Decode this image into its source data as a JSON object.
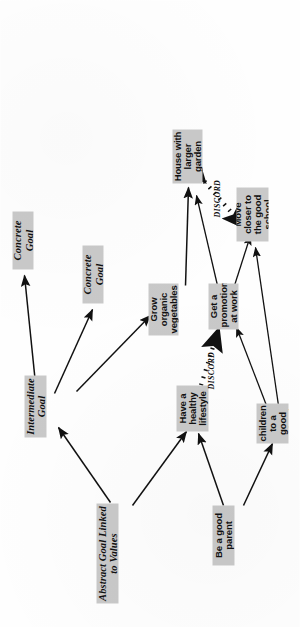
{
  "figure": {
    "box_fill_color": "#c9c9c9",
    "line_color": "#111111",
    "background_color": "#ffffff"
  },
  "legend_nodes": [
    {
      "id": "abstract",
      "label": "Abstract Goal Linked to Values"
    },
    {
      "id": "intermediate",
      "label": "Intermediate Goal"
    },
    {
      "id": "concrete_top",
      "label": "Concrete Goal"
    },
    {
      "id": "concrete_mid",
      "label": "Concrete Goal"
    }
  ],
  "example_nodes": [
    {
      "id": "good_parent",
      "label": "Be a good parent"
    },
    {
      "id": "healthy_lifestyle",
      "label": "Have a healthy lifestyle"
    },
    {
      "id": "send_children",
      "label": "Send children to a good school"
    },
    {
      "id": "grow_vegetables",
      "label": "Grow organic vegetables"
    },
    {
      "id": "promotion",
      "label": "Get a promotion at work"
    },
    {
      "id": "house_garden",
      "label": "House with larger garden"
    },
    {
      "id": "move_closer",
      "label": "Move closer to the good school"
    }
  ],
  "conflict_labels": [
    {
      "id": "discord_upper",
      "label": "DISCORD"
    },
    {
      "id": "discord_lower",
      "label": "DISCORD"
    }
  ],
  "edges": [
    {
      "from": "abstract",
      "to": "intermediate",
      "style": "solid-arrow"
    },
    {
      "from": "intermediate",
      "to": "concrete_top",
      "style": "solid-arrow"
    },
    {
      "from": "intermediate",
      "to": "concrete_mid",
      "style": "solid-arrow"
    },
    {
      "from": "abstract",
      "to": "healthy_lifestyle",
      "style": "solid-arrow"
    },
    {
      "from": "intermediate",
      "to": "grow_vegetables",
      "style": "solid-arrow"
    },
    {
      "from": "good_parent",
      "to": "healthy_lifestyle",
      "style": "solid-arrow"
    },
    {
      "from": "good_parent",
      "to": "send_children",
      "style": "solid-arrow"
    },
    {
      "from": "grow_vegetables",
      "to": "house_garden",
      "style": "solid-arrow"
    },
    {
      "from": "send_children",
      "to": "promotion",
      "style": "solid-arrow"
    },
    {
      "from": "send_children",
      "to": "move_closer",
      "style": "solid-arrow"
    },
    {
      "from": "promotion",
      "to": "house_garden",
      "style": "solid-arrow"
    },
    {
      "from": "promotion",
      "to": "move_closer",
      "style": "solid-arrow"
    },
    {
      "from": "healthy_lifestyle",
      "to": "promotion",
      "style": "dotted-double-arrow",
      "label": "DISCORD"
    },
    {
      "from": "house_garden",
      "to": "move_closer",
      "style": "dotted-double-arrow",
      "label": "DISCORD"
    }
  ]
}
